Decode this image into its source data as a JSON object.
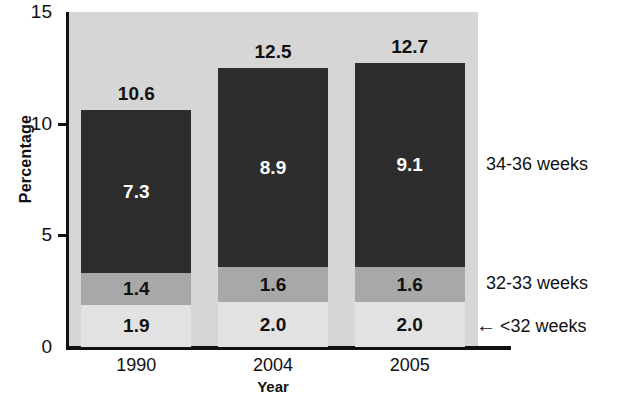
{
  "chart_data": {
    "type": "bar",
    "subtype": "stacked-bar",
    "title": "",
    "xlabel": "Year",
    "ylabel": "Percentage",
    "categories": [
      "1990",
      "2004",
      "2005"
    ],
    "ylim": [
      0,
      15
    ],
    "yticks": [
      "0",
      "5",
      "10",
      "15"
    ],
    "ytick_values": [
      0,
      5,
      10,
      15
    ],
    "grid": false,
    "legend_position": "right-annotation",
    "series": [
      {
        "name": "<32 weeks",
        "values": [
          1.9,
          2.0,
          2.0
        ],
        "labels": [
          "1.9",
          "2.0",
          "2.0"
        ],
        "color": "#e2e2e2",
        "label_color": "#111111"
      },
      {
        "name": "32-33 weeks",
        "values": [
          1.4,
          1.6,
          1.6
        ],
        "labels": [
          "1.4",
          "1.6",
          "1.6"
        ],
        "color": "#a8a8a8",
        "label_color": "#111111"
      },
      {
        "name": "34-36 weeks",
        "values": [
          7.3,
          8.9,
          9.1
        ],
        "labels": [
          "7.3",
          "8.9",
          "9.1"
        ],
        "color": "#2d2d2d",
        "label_color": "#ffffff"
      }
    ],
    "totals": [
      10.6,
      12.5,
      12.7
    ],
    "total_labels": [
      "10.6",
      "12.5",
      "12.7"
    ],
    "annotations": [
      {
        "text": "34-36 weeks",
        "arrow": false
      },
      {
        "text": "32-33 weeks",
        "arrow": false
      },
      {
        "text": "<32 weeks",
        "arrow": true,
        "arrow_glyph": "←"
      }
    ],
    "plot_background": "#d6d6d6",
    "axis_color": "#111111"
  }
}
